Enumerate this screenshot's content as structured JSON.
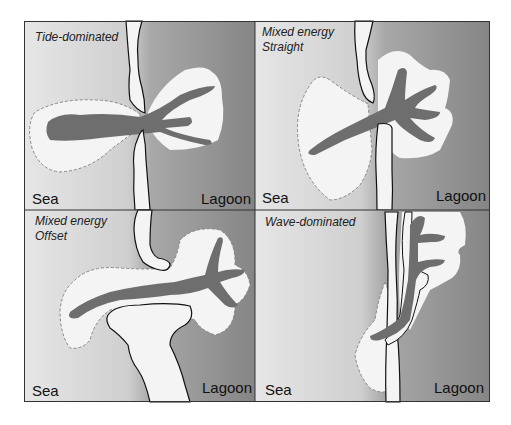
{
  "figure": {
    "panels": [
      {
        "id": "tide-dominated",
        "title_lines": [
          "Tide-dominated"
        ],
        "sea_label": "Sea",
        "lagoon_label": "Lagoon"
      },
      {
        "id": "mixed-energy-straight",
        "title_lines": [
          "Mixed energy",
          "Straight"
        ],
        "sea_label": "Sea",
        "lagoon_label": "Lagoon"
      },
      {
        "id": "mixed-energy-offset",
        "title_lines": [
          "Mixed energy",
          "Offset"
        ],
        "sea_label": "Sea",
        "lagoon_label": "Lagoon"
      },
      {
        "id": "wave-dominated",
        "title_lines": [
          "Wave-dominated"
        ],
        "sea_label": "Sea",
        "lagoon_label": "Lagoon"
      }
    ],
    "colors": {
      "sea": "#e2e2e2",
      "lagoon": "#8a8a8a",
      "sand": "#f4f4f4",
      "channel": "#6e6e6e",
      "outline": "#111111",
      "dashed": "#888888"
    }
  }
}
